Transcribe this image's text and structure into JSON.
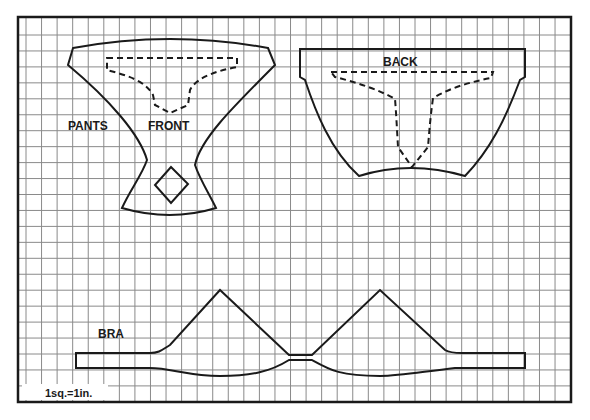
{
  "diagram": {
    "type": "sewing-pattern",
    "scale_note": "1sq.=1in.",
    "grid": {
      "x0": 26,
      "x_step": 15.56,
      "x_count": 35,
      "y0": 35,
      "y_step": 15.95,
      "y_count": 23,
      "border": {
        "x": 18,
        "y": 17,
        "width": 553,
        "height": 385
      }
    },
    "colors": {
      "ink": "#1a1a1a",
      "grid": "#8a8a8a",
      "paper": "#ffffff"
    },
    "pieces": [
      {
        "id": "pants-front",
        "labels": [
          "PANTS",
          "FRONT"
        ]
      },
      {
        "id": "pants-back",
        "labels": [
          "BACK"
        ]
      },
      {
        "id": "bra",
        "labels": [
          "BRA"
        ]
      }
    ]
  },
  "labels": {
    "pants": "PANTS",
    "front": "FRONT",
    "back": "BACK",
    "bra": "BRA",
    "scale": "1sq.=1in."
  }
}
